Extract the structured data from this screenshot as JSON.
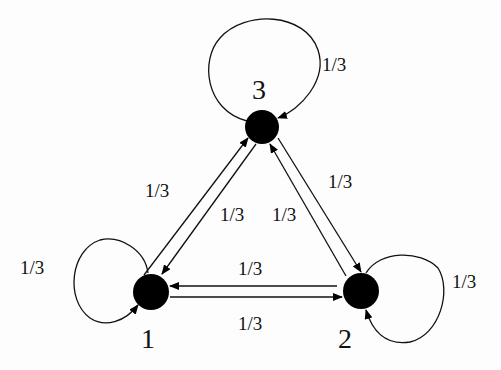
{
  "diagram": {
    "type": "markov-chain",
    "nodes": [
      {
        "id": "1",
        "label": "1",
        "x": 151,
        "y": 292
      },
      {
        "id": "2",
        "label": "2",
        "x": 361,
        "y": 291
      },
      {
        "id": "3",
        "label": "3",
        "x": 262,
        "y": 127
      }
    ],
    "edges": [
      {
        "from": "1",
        "to": "1",
        "label": "1/3"
      },
      {
        "from": "2",
        "to": "2",
        "label": "1/3"
      },
      {
        "from": "3",
        "to": "3",
        "label": "1/3"
      },
      {
        "from": "1",
        "to": "3",
        "label": "1/3"
      },
      {
        "from": "3",
        "to": "1",
        "label": "1/3"
      },
      {
        "from": "3",
        "to": "2",
        "label": "1/3"
      },
      {
        "from": "2",
        "to": "3",
        "label": "1/3"
      },
      {
        "from": "2",
        "to": "1",
        "label": "1/3"
      },
      {
        "from": "1",
        "to": "2",
        "label": "1/3"
      }
    ],
    "colors": {
      "node": "#000000",
      "edge": "#111111",
      "background": "#ffffff"
    }
  }
}
